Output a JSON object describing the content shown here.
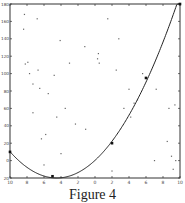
{
  "caption": "Figure 4",
  "chart_data": {
    "type": "line",
    "title": "",
    "xlabel": "",
    "ylabel": "",
    "xlim": [
      -10,
      10
    ],
    "ylim": [
      -20,
      180
    ],
    "grid": false,
    "x_ticks": [
      -10,
      -8,
      -6,
      -4,
      -2,
      0,
      2,
      4,
      6,
      8,
      10
    ],
    "y_ticks": [
      -20,
      0,
      20,
      40,
      60,
      80,
      100,
      120,
      140,
      160,
      180
    ],
    "series": [
      {
        "name": "fitted curve",
        "style": "line",
        "function": "y = (x + 4.5)^2 - 20",
        "marked_points": [
          [
            -10,
            10
          ],
          [
            -5,
            -18
          ],
          [
            2,
            20
          ],
          [
            6,
            95
          ],
          [
            10,
            180
          ]
        ]
      },
      {
        "name": "scatter points",
        "style": "dots",
        "points": [
          [
            -8.3,
            168
          ],
          [
            -6.8,
            163
          ],
          [
            -8.4,
            151
          ],
          [
            -4.1,
            138
          ],
          [
            -1.2,
            131
          ],
          [
            0.4,
            123
          ],
          [
            -8.2,
            111
          ],
          [
            -7.9,
            113
          ],
          [
            -6.7,
            104
          ],
          [
            -7.7,
            100
          ],
          [
            -4.8,
            98
          ],
          [
            -7.3,
            88
          ],
          [
            -6.5,
            83
          ],
          [
            -5.5,
            77
          ],
          [
            0.3,
            117
          ],
          [
            0.5,
            112
          ],
          [
            2.5,
            104
          ],
          [
            -3,
            112
          ],
          [
            -3.5,
            60
          ],
          [
            -7.3,
            55
          ],
          [
            -4.5,
            50
          ],
          [
            -5.8,
            30
          ],
          [
            -6.3,
            25
          ],
          [
            -2.3,
            42
          ],
          [
            -1.1,
            36
          ],
          [
            1.5,
            163
          ],
          [
            2.8,
            140
          ],
          [
            5.6,
            100
          ],
          [
            5.0,
            70
          ],
          [
            3.4,
            60
          ],
          [
            4.0,
            82
          ],
          [
            4.6,
            66
          ],
          [
            7.2,
            82
          ],
          [
            4.2,
            50
          ],
          [
            8.5,
            22
          ],
          [
            9.0,
            5
          ],
          [
            9.2,
            -10
          ],
          [
            9.5,
            0
          ],
          [
            7.0,
            0
          ],
          [
            8.7,
            60
          ],
          [
            9.4,
            64
          ],
          [
            2.0,
            -12
          ],
          [
            -6.0,
            -5
          ],
          [
            -4.0,
            8
          ]
        ]
      }
    ]
  }
}
